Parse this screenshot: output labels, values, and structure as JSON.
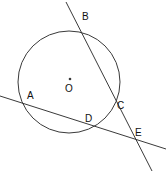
{
  "figure": {
    "width": 166,
    "height": 171,
    "background_color": "#ffffff",
    "stroke_color": "#3a3a3a",
    "label_color": "#111111"
  },
  "circle": {
    "name": "main-circle",
    "center_x": 69,
    "center_y": 82,
    "radius": 51
  },
  "center_point": {
    "label": "O",
    "dot_x": 70,
    "dot_y": 79,
    "label_x": 65,
    "label_y": 84
  },
  "points": [
    {
      "id": "A",
      "label": "A",
      "x": 23,
      "y": 102,
      "label_x": 27,
      "label_y": 91
    },
    {
      "id": "B",
      "label": "B",
      "x": 77,
      "y": 22,
      "label_x": 82,
      "label_y": 12
    },
    {
      "id": "C",
      "label": "C",
      "x": 114,
      "y": 110,
      "label_x": 117,
      "label_y": 101
    },
    {
      "id": "D",
      "label": "D",
      "x": 96,
      "y": 125,
      "label_x": 85,
      "label_y": 114
    },
    {
      "id": "E",
      "label": "E",
      "x": 131,
      "y": 137,
      "label_x": 135,
      "label_y": 128
    }
  ],
  "lines": [
    {
      "id": "secant-bce",
      "through": "B-C-E",
      "x1": 66,
      "y1": 2,
      "x2": 152,
      "y2": 171
    },
    {
      "id": "secant-ade",
      "through": "A-D-E",
      "x1": 0,
      "y1": 96,
      "x2": 166,
      "y2": 149
    }
  ]
}
